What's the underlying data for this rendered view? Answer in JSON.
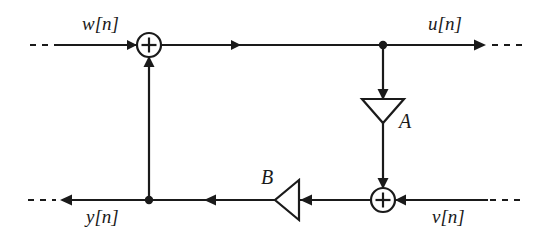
{
  "diagram": {
    "type": "signal-flow-block-diagram",
    "title": "",
    "stroke_color": "#1a1a1a",
    "background_color": "#ffffff",
    "signals": {
      "input_top": "w[n]",
      "output_top": "u[n]",
      "output_bottom": "y[n]",
      "input_bottom": "v[n]"
    },
    "gains": {
      "forward": "A",
      "feedback": "B"
    },
    "adders": {
      "top_sign": "+",
      "bottom_sign": "+"
    },
    "nodes": [
      {
        "name": "adder-top",
        "label": "+",
        "x": 149,
        "y": 45,
        "r": 12
      },
      {
        "name": "adder-bottom",
        "label": "+",
        "x": 383,
        "y": 200,
        "r": 12
      },
      {
        "name": "tap-top",
        "label": "",
        "x": 383,
        "y": 45,
        "r": 4
      },
      {
        "name": "tap-bottom",
        "label": "",
        "x": 149,
        "y": 200,
        "r": 4
      },
      {
        "name": "gain-a",
        "label": "A",
        "x": 383,
        "y": 111,
        "r": 0
      },
      {
        "name": "gain-b",
        "label": "B",
        "x": 287,
        "y": 200,
        "r": 0
      }
    ],
    "edges": [
      {
        "from": "w[n]",
        "to": "adder-top",
        "direction": "right"
      },
      {
        "from": "adder-top",
        "to": "tap-top",
        "direction": "right"
      },
      {
        "from": "tap-top",
        "to": "u[n]",
        "direction": "right"
      },
      {
        "from": "tap-top",
        "to": "gain-a",
        "direction": "down"
      },
      {
        "from": "gain-a",
        "to": "adder-bottom",
        "direction": "down"
      },
      {
        "from": "v[n]",
        "to": "adder-bottom",
        "direction": "left"
      },
      {
        "from": "adder-bottom",
        "to": "gain-b",
        "direction": "left"
      },
      {
        "from": "gain-b",
        "to": "tap-bottom",
        "direction": "left"
      },
      {
        "from": "tap-bottom",
        "to": "y[n]",
        "direction": "left"
      },
      {
        "from": "tap-bottom",
        "to": "adder-top",
        "direction": "up"
      }
    ]
  }
}
